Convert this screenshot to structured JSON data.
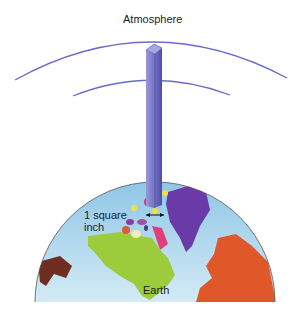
{
  "labels": {
    "atmosphere": "Atmosphere",
    "square_inch_line1": "1 square",
    "square_inch_line2": "inch",
    "earth": "Earth"
  },
  "colors": {
    "atmosphere_arc": "#6a6ac8",
    "column_front": "#7a78c8",
    "column_side": "#4a48a0",
    "column_top": "#9896d6",
    "ocean": "#a9d3ec",
    "north_america": "#9ccb3c",
    "greenland": "#6a3aa8",
    "europe": "#e0582a",
    "asia_fragment": "#6e2e22",
    "arctic_pink": "#e0407a",
    "square_marker": "#f0e040"
  }
}
